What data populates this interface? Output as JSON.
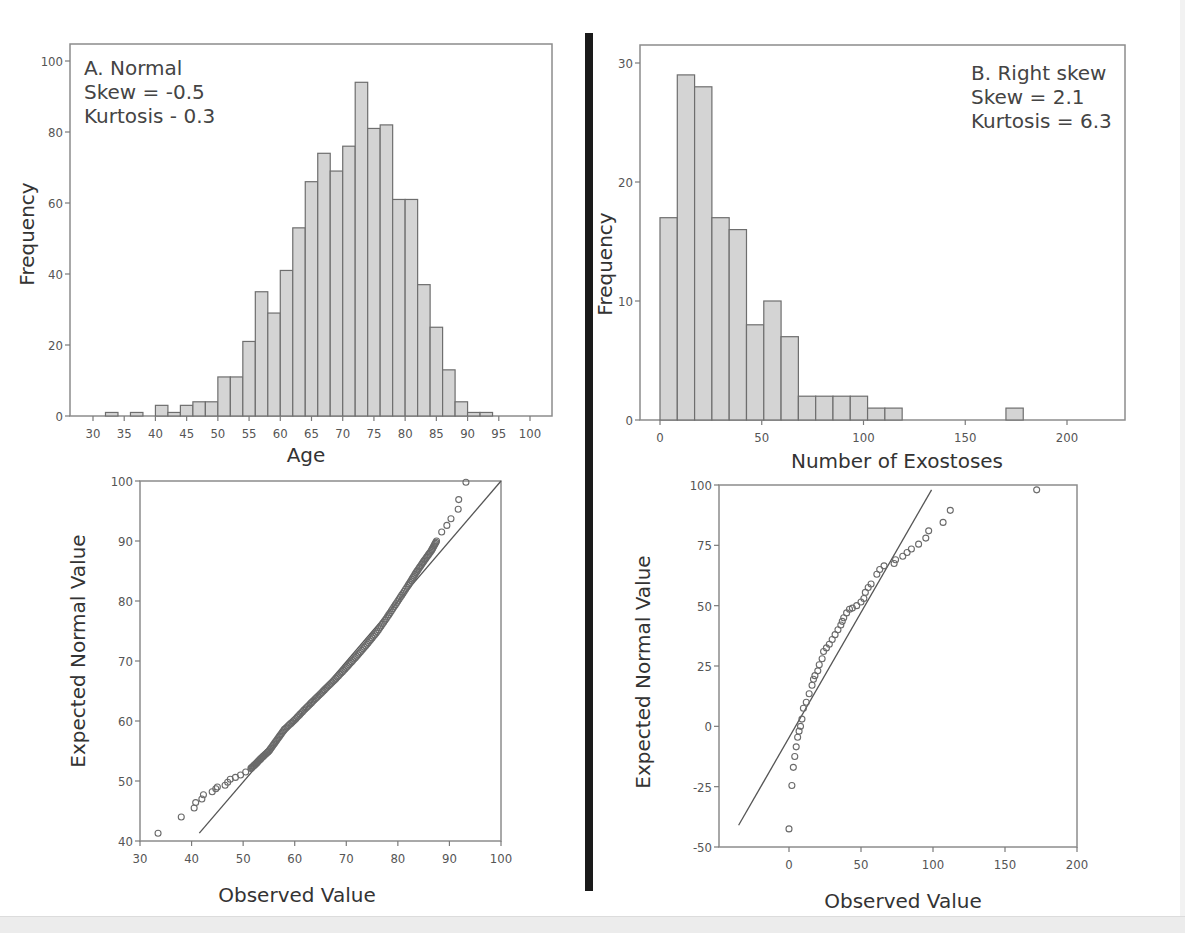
{
  "panels": {
    "A_hist": {
      "annotation": [
        "A. Normal",
        "Skew = -0.5",
        "Kurtosis - 0.3"
      ],
      "xlabel": "Age",
      "ylabel": "Frequency"
    },
    "B_hist": {
      "annotation": [
        "B. Right skew",
        "Skew = 2.1",
        "Kurtosis = 6.3"
      ],
      "xlabel": "Number of Exostoses",
      "ylabel": "Frequency"
    },
    "A_qq": {
      "xlabel": "Observed Value",
      "ylabel": "Expected Normal Value"
    },
    "B_qq": {
      "xlabel": "Observed Value",
      "ylabel": "Expected Normal Value"
    }
  },
  "colors": {
    "bar_fill": "#d4d4d4",
    "bar_stroke": "#6e6e6e",
    "axis": "#7a7a7a",
    "frame": "#8c8c8c",
    "point": "#6a6a6a",
    "line": "#555555",
    "divider": "#1a1a1a"
  },
  "chart_data": [
    {
      "id": "A_hist",
      "type": "bar",
      "title": "A. Normal",
      "annotations": [
        "Skew = -0.5",
        "Kurtosis - 0.3"
      ],
      "xlabel": "Age",
      "ylabel": "Frequency",
      "xlim": [
        26,
        104
      ],
      "ylim": [
        0,
        105
      ],
      "xticks": [
        30,
        35,
        40,
        45,
        50,
        55,
        60,
        65,
        70,
        75,
        80,
        85,
        90,
        95,
        100
      ],
      "yticks": [
        0,
        20,
        40,
        60,
        80,
        100
      ],
      "bin_width": 2,
      "bin_starts": [
        32,
        34,
        36,
        38,
        40,
        42,
        44,
        46,
        48,
        50,
        52,
        54,
        56,
        58,
        60,
        62,
        64,
        66,
        68,
        70,
        72,
        74,
        76,
        78,
        80,
        82,
        84,
        86,
        88,
        90,
        92
      ],
      "values": [
        1,
        0,
        1,
        0,
        3,
        1,
        3,
        4,
        4,
        11,
        11,
        21,
        35,
        29,
        41,
        53,
        66,
        74,
        69,
        76,
        94,
        81,
        82,
        61,
        61,
        37,
        25,
        13,
        4,
        1,
        1
      ],
      "grid": false
    },
    {
      "id": "B_hist",
      "type": "bar",
      "title": "B. Right skew",
      "annotations": [
        "Skew = 2.1",
        "Kurtosis = 6.3"
      ],
      "xlabel": "Number of Exostoses",
      "ylabel": "Frequency",
      "xlim": [
        -15,
        210
      ],
      "ylim": [
        0,
        31.5
      ],
      "xticks": [
        0,
        50,
        100,
        150,
        200
      ],
      "yticks": [
        0,
        10,
        20,
        30
      ],
      "bin_width": 8.5,
      "bin_starts": [
        0,
        8.5,
        17,
        25.5,
        34,
        42.5,
        51,
        59.5,
        68,
        76.5,
        85,
        93.5,
        102,
        110.5,
        119,
        127.5,
        136,
        144.5,
        153,
        161.5,
        170
      ],
      "values": [
        17,
        29,
        28,
        17,
        16,
        8,
        10,
        7,
        2,
        2,
        2,
        2,
        1,
        1,
        0,
        0,
        0,
        0,
        0,
        0,
        1
      ],
      "grid": false
    },
    {
      "id": "A_qq",
      "type": "scatter",
      "title": "",
      "xlabel": "Observed Value",
      "ylabel": "Expected Normal Value",
      "xlim": [
        30,
        100
      ],
      "ylim": [
        40,
        100
      ],
      "xticks": [
        30,
        40,
        50,
        60,
        70,
        80,
        90,
        100
      ],
      "yticks": [
        40,
        50,
        60,
        70,
        80,
        90,
        100
      ],
      "reference_line": [
        [
          41.5,
          41.3
        ],
        [
          100,
          100
        ]
      ],
      "points": [
        [
          33.5,
          41.3
        ],
        [
          38,
          44
        ],
        [
          40.5,
          45.5
        ],
        [
          40.8,
          46.4
        ],
        [
          42,
          47
        ],
        [
          42.3,
          47.7
        ],
        [
          44,
          48.2
        ],
        [
          44.7,
          48.7
        ],
        [
          45,
          49
        ],
        [
          46.5,
          49.3
        ],
        [
          47,
          49.8
        ],
        [
          47.5,
          50.3
        ],
        [
          48.5,
          50.6
        ],
        [
          49.5,
          51
        ],
        [
          50.5,
          51.5
        ],
        [
          51.5,
          52.1
        ],
        [
          52.5,
          52.9
        ],
        [
          53.5,
          53.8
        ],
        [
          55,
          55
        ],
        [
          56.5,
          56.8
        ],
        [
          58,
          58.6
        ],
        [
          60,
          60.2
        ],
        [
          62,
          62
        ],
        [
          64,
          63.7
        ],
        [
          66,
          65.4
        ],
        [
          68,
          67.1
        ],
        [
          70,
          68.9
        ],
        [
          72,
          70.8
        ],
        [
          74,
          72.8
        ],
        [
          76,
          74.9
        ],
        [
          78,
          77.4
        ],
        [
          80,
          80
        ],
        [
          82,
          82.6
        ],
        [
          83.5,
          84.7
        ],
        [
          85,
          86.6
        ],
        [
          86.5,
          88.4
        ],
        [
          87.5,
          90
        ],
        [
          88.5,
          91.5
        ],
        [
          89.5,
          92.6
        ],
        [
          90.3,
          93.7
        ],
        [
          91.7,
          95.3
        ],
        [
          91.8,
          96.9
        ],
        [
          93.2,
          99.8
        ]
      ],
      "grid": false
    },
    {
      "id": "B_qq",
      "type": "scatter",
      "title": "",
      "xlabel": "Observed Value",
      "ylabel": "Expected Normal Value",
      "xlim": [
        -48.6,
        200
      ],
      "ylim": [
        -50,
        100
      ],
      "xticks": [
        0,
        50,
        100,
        150,
        200
      ],
      "yticks": [
        -50,
        -25,
        0,
        25,
        50,
        75,
        100
      ],
      "reference_line": [
        [
          -35,
          -41
        ],
        [
          99,
          98
        ]
      ],
      "points": [
        [
          0,
          -42.5
        ],
        [
          2,
          -24.5
        ],
        [
          3,
          -17
        ],
        [
          4,
          -12.5
        ],
        [
          5,
          -8.5
        ],
        [
          6,
          -4.5
        ],
        [
          7,
          -2
        ],
        [
          8,
          0
        ],
        [
          9,
          3
        ],
        [
          10,
          7.5
        ],
        [
          12,
          10
        ],
        [
          14,
          13.5
        ],
        [
          16,
          17
        ],
        [
          17,
          19.5
        ],
        [
          18,
          21
        ],
        [
          20,
          23
        ],
        [
          21,
          25.5
        ],
        [
          23,
          28
        ],
        [
          24,
          31
        ],
        [
          26,
          32.5
        ],
        [
          28,
          34
        ],
        [
          30,
          36
        ],
        [
          32,
          38
        ],
        [
          34,
          40
        ],
        [
          36,
          42
        ],
        [
          37,
          43.5
        ],
        [
          38,
          45
        ],
        [
          40,
          47
        ],
        [
          42,
          48.5
        ],
        [
          44,
          49
        ],
        [
          47,
          50
        ],
        [
          50,
          51.5
        ],
        [
          52,
          53
        ],
        [
          53,
          55.5
        ],
        [
          55,
          57.5
        ],
        [
          57,
          59
        ],
        [
          61,
          63
        ],
        [
          63,
          65
        ],
        [
          66,
          66.5
        ],
        [
          73,
          67.5
        ],
        [
          74,
          69
        ],
        [
          79,
          70.5
        ],
        [
          82,
          72
        ],
        [
          85,
          73.5
        ],
        [
          90,
          75.5
        ],
        [
          95,
          78
        ],
        [
          97,
          81
        ],
        [
          107,
          84.5
        ],
        [
          112,
          89.5
        ],
        [
          172,
          98
        ]
      ],
      "grid": false
    }
  ]
}
